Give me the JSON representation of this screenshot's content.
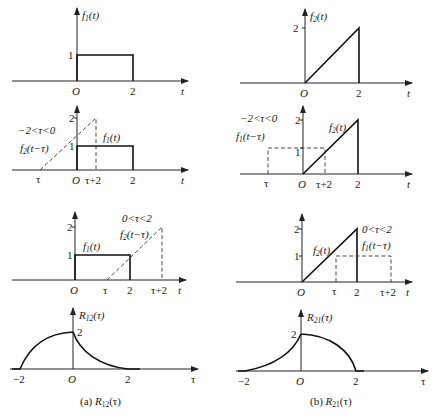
{
  "labels": {
    "axis_t": "t",
    "axis_tau": "τ",
    "origin": "O",
    "one": "1",
    "two": "2",
    "neg_two": "−2",
    "tau": "τ",
    "tau_plus_2": "τ+2",
    "f1": "f",
    "f1_sub": "1",
    "f2": "f",
    "f2_sub": "2",
    "of_t": "(t)",
    "of_t_minus_tau": "(t−τ)",
    "R": "R",
    "R12_sub": "12",
    "R21_sub": "21",
    "of_tau": "(τ)",
    "cond_neg": "−2<τ<0",
    "cond_pos": "0<τ<2"
  },
  "captions": {
    "a_prefix": "(a) ",
    "b_prefix": "(b) "
  },
  "panels": [
    {
      "id": "a1",
      "title": "f1(t)",
      "shape": "rect",
      "height": 1,
      "range": [
        0,
        2
      ]
    },
    {
      "id": "b1",
      "title": "f2(t)",
      "shape": "ramp",
      "peak": 2,
      "range": [
        0,
        2
      ]
    },
    {
      "id": "a2",
      "condition": "−2<τ<0",
      "solid": "f1(t)",
      "dashed": "f2(t−τ)"
    },
    {
      "id": "b2",
      "condition": "−2<τ<0",
      "solid": "f2(t)",
      "dashed": "f1(t−τ)"
    },
    {
      "id": "a3",
      "condition": "0<τ<2",
      "solid": "f1(t)",
      "dashed": "f2(t−τ)"
    },
    {
      "id": "b3",
      "condition": "0<τ<2",
      "solid": "f2(t)",
      "dashed": "f1(t−τ)"
    },
    {
      "id": "a4",
      "title": "R12(τ)",
      "support": [
        -2,
        2
      ],
      "peak": 2,
      "caption": "(a) R12(τ)"
    },
    {
      "id": "b4",
      "title": "R21(τ)",
      "support": [
        -2,
        2
      ],
      "peak": 2,
      "caption": "(b) R21(τ)"
    }
  ]
}
